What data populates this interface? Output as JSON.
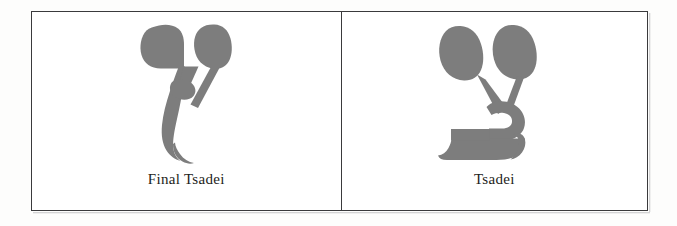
{
  "figure": {
    "type": "letter-chart",
    "background_color": "#fdfdfc",
    "frame_color": "#3a3a3c",
    "glyph_color": "#7d7d7d",
    "caption_color": "#1d1d20",
    "cells": [
      {
        "id": "final-tsadei",
        "caption": "Final Tsadei",
        "glyph_name": "hebrew-letter-final-tsadi",
        "glyph_character": "ץ",
        "glyph_color": "#7d7d7d"
      },
      {
        "id": "tsadei",
        "caption": "Tsadei",
        "glyph_name": "hebrew-letter-tsadi",
        "glyph_character": "צ",
        "glyph_color": "#7d7d7d"
      }
    ]
  }
}
